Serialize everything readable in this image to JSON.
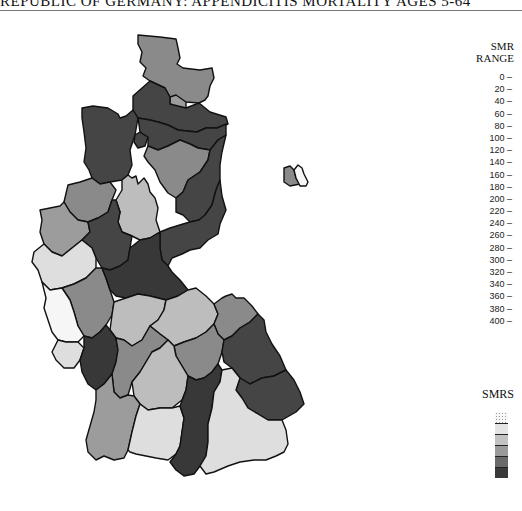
{
  "title": "REPUBLIC OF GERMANY: APPENDICITIS MORTALITY AGES 5-64",
  "legend": {
    "smr_heading_line1": "SMR",
    "smr_heading_line2": "RANGE",
    "ranges": [
      "0 –",
      "20 –",
      "40 –",
      "60 –",
      "80 –",
      "100 –",
      "120 –",
      "140 –",
      "160 –",
      "180 –",
      "200 –",
      "220 –",
      "240 –",
      "260 –",
      "280 –",
      "300 –",
      "320 –",
      "340 –",
      "360 –",
      "380 –",
      "400 –"
    ],
    "smrs_heading": "SMRS",
    "swatch_colors": [
      "#f7f7f7",
      "#e4e4e4",
      "#c2c2c2",
      "#9a9a9a",
      "#6a6a6a",
      "#3a3a3a"
    ]
  },
  "shades": {
    "white": "#f6f6f6",
    "light": "#dedede",
    "lightmid": "#bdbdbd",
    "mid": "#9c9c9c",
    "midgray": "#8a8a8a",
    "dark": "#454545",
    "darkest": "#383838"
  },
  "regions": [
    {
      "name": "schleswig-holstein",
      "shade": "midgray"
    },
    {
      "name": "hamburg",
      "shade": "mid"
    },
    {
      "name": "lower-saxony-north",
      "shade": "dark"
    },
    {
      "name": "lower-saxony-east",
      "shade": "dark"
    },
    {
      "name": "bremen-area",
      "shade": "dark"
    },
    {
      "name": "weser-ems",
      "shade": "dark"
    },
    {
      "name": "hanover",
      "shade": "midgray"
    },
    {
      "name": "brunswick",
      "shade": "dark"
    },
    {
      "name": "muenster",
      "shade": "midgray"
    },
    {
      "name": "detmold",
      "shade": "lightmid"
    },
    {
      "name": "duesseldorf",
      "shade": "mid"
    },
    {
      "name": "arnsberg",
      "shade": "dark"
    },
    {
      "name": "cologne",
      "shade": "light"
    },
    {
      "name": "kassel",
      "shade": "dark"
    },
    {
      "name": "koblenz",
      "shade": "midgray"
    },
    {
      "name": "trier",
      "shade": "white"
    },
    {
      "name": "darmstadt",
      "shade": "darkest"
    },
    {
      "name": "giessen",
      "shade": "lightmid"
    },
    {
      "name": "lower-franconia",
      "shade": "lightmid"
    },
    {
      "name": "upper-franconia",
      "shade": "midgray"
    },
    {
      "name": "saarland",
      "shade": "light"
    },
    {
      "name": "rhine-hesse-palatinate",
      "shade": "darkest"
    },
    {
      "name": "karlsruhe",
      "shade": "midgray"
    },
    {
      "name": "middle-franconia",
      "shade": "midgray"
    },
    {
      "name": "upper-palatinate",
      "shade": "dark"
    },
    {
      "name": "stuttgart",
      "shade": "lightmid"
    },
    {
      "name": "lower-bavaria",
      "shade": "dark"
    },
    {
      "name": "freiburg",
      "shade": "mid"
    },
    {
      "name": "tuebingen",
      "shade": "light"
    },
    {
      "name": "swabia",
      "shade": "darkest"
    },
    {
      "name": "upper-bavaria",
      "shade": "light"
    },
    {
      "name": "berlin-west",
      "shade": "midgray"
    },
    {
      "name": "berlin-east-part",
      "shade": "white"
    }
  ]
}
